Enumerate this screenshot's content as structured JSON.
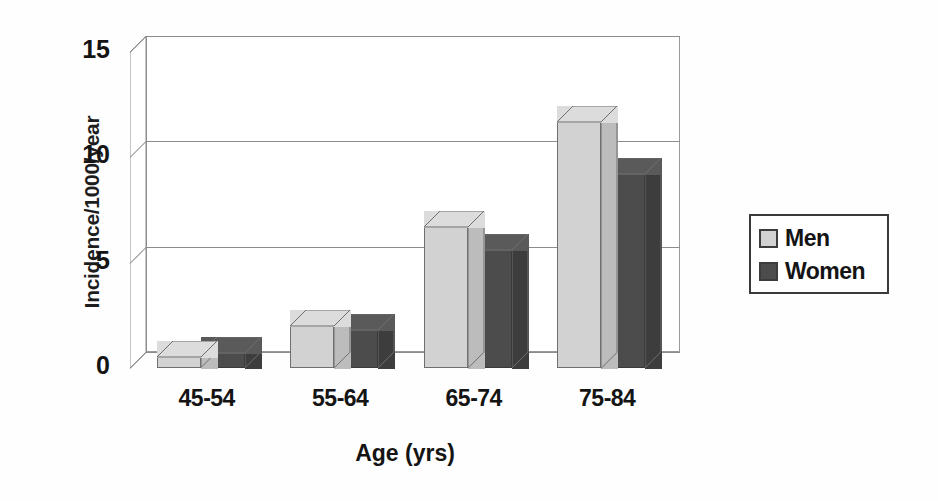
{
  "chart_data": {
    "type": "bar",
    "title": "",
    "subtitle": "",
    "xlabel": "Age (yrs)",
    "ylabel": "Incidence/1000/year",
    "categories": [
      "45-54",
      "55-64",
      "65-74",
      "75-84"
    ],
    "series": [
      {
        "name": "Men",
        "values": [
          0.5,
          2.0,
          6.7,
          11.7
        ],
        "color": "#d2d2d2"
      },
      {
        "name": "Women",
        "values": [
          0.7,
          1.8,
          5.6,
          9.2
        ],
        "color": "#4c4c4c"
      }
    ],
    "ylim": [
      0,
      15
    ],
    "yticks": [
      0,
      5,
      10,
      15
    ],
    "ytick_labels": [
      "0",
      "5",
      "10",
      "15"
    ],
    "grid": true,
    "grid_axis": "y",
    "legend_position": "right",
    "style": "3d-column",
    "background": "#ffffff",
    "axis_color": "#8c8c8c",
    "text_color": "#141414"
  },
  "legend": {
    "entries": [
      {
        "label": "Men",
        "swatch": "#d2d2d2"
      },
      {
        "label": "Women",
        "swatch": "#4c4c4c"
      }
    ]
  }
}
